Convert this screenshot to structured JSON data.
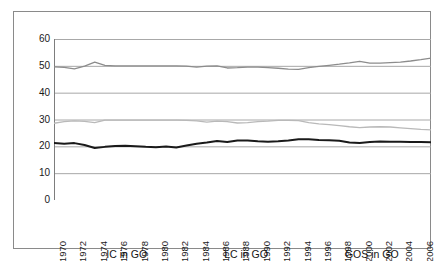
{
  "chart_data": {
    "type": "line",
    "title": "",
    "xlabel": "",
    "ylabel": "",
    "ylim": [
      0,
      60
    ],
    "yticks": [
      0,
      10,
      20,
      30,
      40,
      50,
      60
    ],
    "grid": true,
    "legend_position": "bottom",
    "x": [
      1970,
      1971,
      1972,
      1973,
      1974,
      1975,
      1976,
      1977,
      1978,
      1979,
      1980,
      1981,
      1982,
      1983,
      1984,
      1985,
      1986,
      1987,
      1988,
      1989,
      1990,
      1991,
      1992,
      1993,
      1994,
      1995,
      1996,
      1997,
      1998,
      1999,
      2000,
      2001,
      2002,
      2003,
      2004,
      2005,
      2006,
      2007
    ],
    "xtick_labels": [
      "1970",
      "1972",
      "1974",
      "1976",
      "1978",
      "1980",
      "1982",
      "1984",
      "1986",
      "1988",
      "1990",
      "1992",
      "1994",
      "1996",
      "1998",
      "2000",
      "2002",
      "2004",
      "2006"
    ],
    "series": [
      {
        "name": "IC in GO",
        "color": "#8c8c8c",
        "width": 1.3,
        "values": [
          49.6,
          49.4,
          48.9,
          49.9,
          51.4,
          50.2,
          50.0,
          50.0,
          50.0,
          50.0,
          50.0,
          50.0,
          50.0,
          49.9,
          49.5,
          49.9,
          50.0,
          49.2,
          49.3,
          49.5,
          49.5,
          49.3,
          49.1,
          48.8,
          48.7,
          49.3,
          49.8,
          50.2,
          50.6,
          51.1,
          51.7,
          51.0,
          51.0,
          51.2,
          51.4,
          51.8,
          52.3,
          52.9
        ]
      },
      {
        "name": "LC in GO",
        "color": "#b9b9b9",
        "width": 1.3,
        "values": [
          28.6,
          29.2,
          29.5,
          29.3,
          28.8,
          29.8,
          29.8,
          29.8,
          29.8,
          29.8,
          29.8,
          29.8,
          29.8,
          29.7,
          29.5,
          29.0,
          29.4,
          29.2,
          28.7,
          28.8,
          29.2,
          29.4,
          29.7,
          29.7,
          29.6,
          28.8,
          28.4,
          28.1,
          27.7,
          27.3,
          27.0,
          27.2,
          27.3,
          27.2,
          26.9,
          26.6,
          26.3,
          26.1
        ]
      },
      {
        "name": "GOS in GO",
        "color": "#1a1a1a",
        "width": 2.0,
        "values": [
          21.2,
          21.0,
          21.2,
          20.5,
          19.4,
          19.8,
          20.1,
          20.2,
          20.0,
          19.8,
          19.7,
          19.9,
          19.6,
          20.3,
          21.0,
          21.4,
          22.0,
          21.6,
          22.2,
          22.2,
          21.9,
          21.7,
          21.9,
          22.2,
          22.6,
          22.6,
          22.4,
          22.3,
          22.1,
          21.4,
          21.2,
          21.6,
          21.8,
          21.7,
          21.7,
          21.6,
          21.6,
          21.5
        ]
      }
    ]
  },
  "legend": {
    "items": [
      {
        "label": "IC in GO"
      },
      {
        "label": "LC in GO"
      },
      {
        "label": "GOS in GO"
      }
    ]
  }
}
